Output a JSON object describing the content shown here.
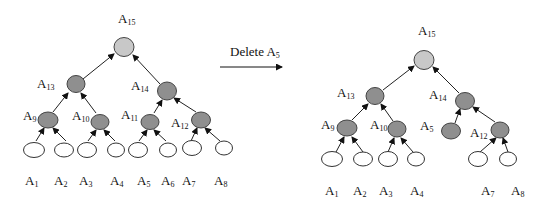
{
  "diagram": {
    "title_left": "Binary tree before deletion",
    "operation": {
      "label": "Delete A",
      "label_subscript": "5"
    },
    "colors": {
      "root_fill": "#c8c8c8",
      "inner_fill": "#8f8f8f",
      "leaf_fill": "#ffffff",
      "stroke": "#444444"
    },
    "left_tree": {
      "nodes": [
        {
          "id": "A15",
          "letter": "A",
          "sub": "15",
          "type": "root"
        },
        {
          "id": "A13",
          "letter": "A",
          "sub": "13",
          "type": "inner"
        },
        {
          "id": "A14",
          "letter": "A",
          "sub": "14",
          "type": "inner"
        },
        {
          "id": "A9",
          "letter": "A",
          "sub": "9",
          "type": "inner"
        },
        {
          "id": "A10",
          "letter": "A",
          "sub": "10",
          "type": "inner"
        },
        {
          "id": "A11",
          "letter": "A",
          "sub": "11",
          "type": "inner"
        },
        {
          "id": "A12",
          "letter": "A",
          "sub": "12",
          "type": "inner"
        },
        {
          "id": "A1",
          "letter": "A",
          "sub": "1",
          "type": "leaf"
        },
        {
          "id": "A2",
          "letter": "A",
          "sub": "2",
          "type": "leaf"
        },
        {
          "id": "A3",
          "letter": "A",
          "sub": "3",
          "type": "leaf"
        },
        {
          "id": "A4",
          "letter": "A",
          "sub": "4",
          "type": "leaf"
        },
        {
          "id": "A5",
          "letter": "A",
          "sub": "5",
          "type": "leaf"
        },
        {
          "id": "A6",
          "letter": "A",
          "sub": "6",
          "type": "leaf"
        },
        {
          "id": "A7",
          "letter": "A",
          "sub": "7",
          "type": "leaf"
        },
        {
          "id": "A8",
          "letter": "A",
          "sub": "8",
          "type": "leaf"
        }
      ],
      "edges": [
        [
          "A13",
          "A15"
        ],
        [
          "A14",
          "A15"
        ],
        [
          "A9",
          "A13"
        ],
        [
          "A10",
          "A13"
        ],
        [
          "A11",
          "A14"
        ],
        [
          "A12",
          "A14"
        ],
        [
          "A1",
          "A9"
        ],
        [
          "A2",
          "A9"
        ],
        [
          "A3",
          "A10"
        ],
        [
          "A4",
          "A10"
        ],
        [
          "A5",
          "A11"
        ],
        [
          "A6",
          "A11"
        ],
        [
          "A7",
          "A12"
        ],
        [
          "A8",
          "A12"
        ]
      ]
    },
    "right_tree": {
      "nodes": [
        {
          "id": "A15",
          "letter": "A",
          "sub": "15",
          "type": "root"
        },
        {
          "id": "A13",
          "letter": "A",
          "sub": "13",
          "type": "inner"
        },
        {
          "id": "A14",
          "letter": "A",
          "sub": "14",
          "type": "inner"
        },
        {
          "id": "A9",
          "letter": "A",
          "sub": "9",
          "type": "inner"
        },
        {
          "id": "A10",
          "letter": "A",
          "sub": "10",
          "type": "inner"
        },
        {
          "id": "A5",
          "letter": "A",
          "sub": "5",
          "type": "inner"
        },
        {
          "id": "A12",
          "letter": "A",
          "sub": "12",
          "type": "inner"
        },
        {
          "id": "A1",
          "letter": "A",
          "sub": "1",
          "type": "leaf"
        },
        {
          "id": "A2",
          "letter": "A",
          "sub": "2",
          "type": "leaf"
        },
        {
          "id": "A3",
          "letter": "A",
          "sub": "3",
          "type": "leaf"
        },
        {
          "id": "A4",
          "letter": "A",
          "sub": "4",
          "type": "leaf"
        },
        {
          "id": "A7",
          "letter": "A",
          "sub": "7",
          "type": "leaf"
        },
        {
          "id": "A8",
          "letter": "A",
          "sub": "8",
          "type": "leaf"
        }
      ],
      "edges": [
        [
          "A13",
          "A15"
        ],
        [
          "A14",
          "A15"
        ],
        [
          "A9",
          "A13"
        ],
        [
          "A10",
          "A13"
        ],
        [
          "A5",
          "A14"
        ],
        [
          "A12",
          "A14"
        ],
        [
          "A1",
          "A9"
        ],
        [
          "A2",
          "A9"
        ],
        [
          "A3",
          "A10"
        ],
        [
          "A4",
          "A10"
        ],
        [
          "A7",
          "A12"
        ],
        [
          "A8",
          "A12"
        ]
      ]
    }
  }
}
